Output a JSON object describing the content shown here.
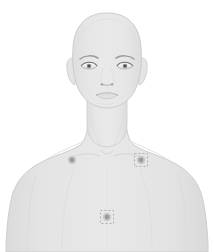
{
  "view": {
    "title": "Body Map",
    "subject_orientation": "anterior",
    "background_color": "#ffffff",
    "width": 214,
    "height": 252
  },
  "figure": {
    "name": "human-upper-body-front",
    "region": "head-neck-shoulders-chest",
    "skin_fill": "#e3e3e3",
    "skin_fill_light": "#e9e9e9",
    "skin_fill_shadow": "#dcdcdc",
    "outline_color": "#cfcfcf",
    "feature_line_color": "#b9b9b9",
    "hair_color": "#8c8c8c",
    "crop_note": "torso cropped at bottom edge"
  },
  "markers": [
    {
      "id": "marker-1",
      "label": "Right clavicle",
      "x": 72,
      "y": 160,
      "selected": false,
      "color": "#9b9b9b",
      "ring_color": "#c9c9c9"
    },
    {
      "id": "marker-2",
      "label": "Left clavicle",
      "x": 141,
      "y": 160,
      "selected": true,
      "color": "#9b9b9b",
      "ring_color": "#c9c9c9"
    },
    {
      "id": "marker-3",
      "label": "Sternum",
      "x": 107,
      "y": 217,
      "selected": true,
      "color": "#9b9b9b",
      "ring_color": "#c9c9c9"
    }
  ],
  "selection": {
    "stroke_color": "#b0b0b0",
    "dash_pattern": "2 2",
    "box_size": 13
  }
}
